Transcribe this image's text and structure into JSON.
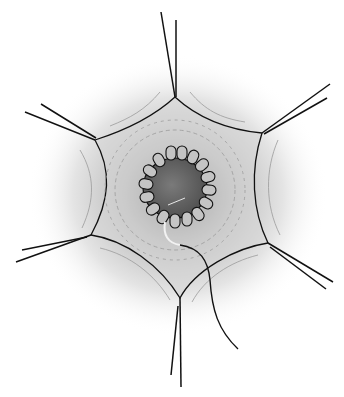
{
  "figure": {
    "colors": {
      "background": "#ffffff",
      "tissue_shade": "#8a8a8a",
      "lumen": "#6a6a6a",
      "ring_segment": "#bdbdbd",
      "line": "#111111",
      "suture_white": "#f2f2f2"
    },
    "traction_sutures": [
      {
        "position": "top",
        "anchor": [
          175,
          97
        ]
      },
      {
        "position": "upper-right",
        "anchor": [
          262,
          133
        ]
      },
      {
        "position": "lower-right",
        "anchor": [
          268,
          243
        ]
      },
      {
        "position": "bottom",
        "anchor": [
          180,
          298
        ]
      },
      {
        "position": "lower-left",
        "anchor": [
          91,
          235
        ]
      },
      {
        "position": "upper-left",
        "anchor": [
          95,
          140
        ]
      }
    ],
    "ring_segments": 16,
    "center": [
      175,
      190
    ]
  }
}
